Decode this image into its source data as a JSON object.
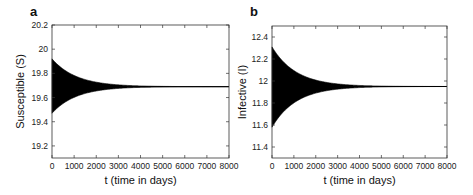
{
  "chart_data": [
    {
      "type": "line",
      "panel_label": "a",
      "title": "",
      "xlabel": "t (time in days)",
      "ylabel": "Susceptible (S)",
      "xlim": [
        0,
        8000
      ],
      "ylim": [
        19.1,
        20.2
      ],
      "xticks": [
        0,
        1000,
        2000,
        3000,
        4000,
        5000,
        6000,
        7000,
        8000
      ],
      "xtick_labels": [
        "0",
        "1000",
        "2000",
        "3000",
        "4000",
        "5000",
        "6000",
        "7000",
        "8000"
      ],
      "yticks": [
        19.2,
        19.4,
        19.6,
        19.8,
        20,
        20.2
      ],
      "ytick_labels": [
        "19.2",
        "19.4",
        "19.6",
        "19.8",
        "20",
        "20.2"
      ],
      "grid": false,
      "series": [
        {
          "name": "S(t) damped oscillation",
          "equilibrium": 19.69,
          "envelope_upper_start": 19.92,
          "envelope_lower_start": 19.47,
          "decay_time_constant_days": 1100,
          "color": "#000000"
        }
      ]
    },
    {
      "type": "line",
      "panel_label": "b",
      "title": "",
      "xlabel": "t (time in days)",
      "ylabel": "Infective (I)",
      "xlim": [
        0,
        8000
      ],
      "ylim": [
        11.3,
        12.5
      ],
      "xticks": [
        0,
        1000,
        2000,
        3000,
        4000,
        5000,
        6000,
        7000,
        8000
      ],
      "xtick_labels": [
        "0",
        "1000",
        "2000",
        "3000",
        "4000",
        "5000",
        "6000",
        "7000",
        "8000"
      ],
      "yticks": [
        11.4,
        11.6,
        11.8,
        12,
        12.2,
        12.4
      ],
      "ytick_labels": [
        "11.4",
        "11.6",
        "11.8",
        "12",
        "12.2",
        "12.4"
      ],
      "grid": false,
      "series": [
        {
          "name": "I(t) damped oscillation",
          "equilibrium": 11.95,
          "envelope_upper_start": 12.31,
          "envelope_lower_start": 11.58,
          "decay_time_constant_days": 1100,
          "color": "#000000"
        }
      ]
    }
  ]
}
